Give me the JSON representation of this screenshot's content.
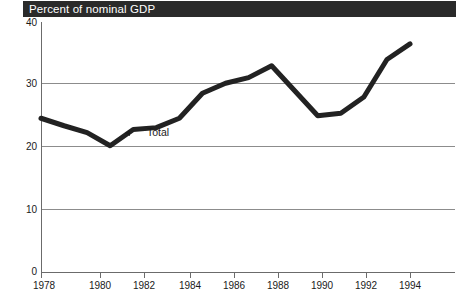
{
  "title": {
    "text": "Percent of nominal GDP",
    "bar_color": "#2a2a2a",
    "text_color": "#ffffff"
  },
  "axes": {
    "y_ticks": [
      "40",
      "30",
      "20",
      "10",
      "0"
    ],
    "x_ticks": [
      "1978",
      "1980",
      "1982",
      "1984",
      "1986",
      "1988",
      "1990",
      "1992",
      "1994"
    ]
  },
  "annotations": {
    "total_label": "Total",
    "arrow_icon": "left-arrow-icon"
  },
  "chart_data": {
    "type": "line",
    "title": "Percent of nominal GDP",
    "xlabel": "",
    "ylabel": "Percent of nominal GDP",
    "xlim": [
      1978,
      1994
    ],
    "ylim": [
      0,
      40
    ],
    "ytick_values": [
      40,
      30,
      20,
      10,
      0
    ],
    "xtick_values": [
      1978,
      1980,
      1982,
      1984,
      1986,
      1988,
      1990,
      1992,
      1994
    ],
    "grid": true,
    "grid_axis": "y",
    "legend": "none",
    "line_color": "#222222",
    "line_width_px": 5,
    "series": [
      {
        "name": "Total",
        "x": [
          1978,
          1979,
          1980,
          1981,
          1982,
          1983,
          1984,
          1985,
          1986,
          1987,
          1988,
          1989,
          1990,
          1991,
          1992,
          1993,
          1994
        ],
        "values": [
          24.6,
          23.4,
          22.3,
          20.2,
          22.8,
          23.1,
          24.6,
          28.6,
          30.2,
          31.1,
          33.0,
          29.0,
          25.0,
          25.4,
          28.0,
          34.0,
          36.5
        ]
      }
    ]
  }
}
